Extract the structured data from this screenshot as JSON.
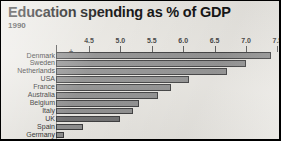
{
  "chart": {
    "title": "Education spending as % of GDP",
    "subtitle": "1990"
  },
  "axis": {
    "tick_labels": [
      "4.5",
      "5.0",
      "5.5",
      "6.0",
      "6.5",
      "7.0",
      "7.5"
    ],
    "break_symbol": "+"
  },
  "chart_data": {
    "type": "bar",
    "orientation": "horizontal",
    "title": "Education spending as % of GDP",
    "subtitle": "1990",
    "xlabel": "",
    "ylabel": "",
    "xlim": [
      4.0,
      7.6
    ],
    "xticks": [
      4.5,
      5.0,
      5.5,
      6.0,
      6.5,
      7.0,
      7.5
    ],
    "grid": false,
    "legend": "none",
    "axis_break": true,
    "categories": [
      "Denmark",
      "Sweden",
      "Netherlands",
      "USA",
      "France",
      "Australia",
      "Belgium",
      "Italy",
      "UK",
      "Spain",
      "Germany"
    ],
    "values": [
      7.4,
      7.0,
      6.7,
      6.1,
      5.8,
      5.6,
      5.3,
      5.2,
      5.0,
      4.4,
      4.1
    ],
    "series": [
      {
        "name": "Education spending as % of GDP (1990)",
        "values": [
          7.4,
          7.0,
          6.7,
          6.1,
          5.8,
          5.6,
          5.3,
          5.2,
          5.0,
          4.4,
          4.1
        ]
      }
    ]
  },
  "colors": {
    "background": "#e9e7e2",
    "bar_fill": "#8d8d8d",
    "bar_fill_dark": "#6f6f70",
    "bar_outline": "#39393a",
    "frame": "#000000",
    "text": "#1d1d1d"
  }
}
